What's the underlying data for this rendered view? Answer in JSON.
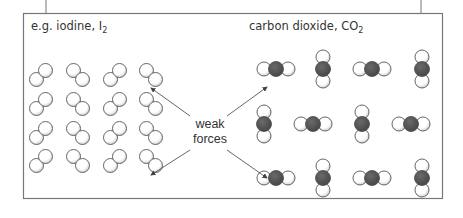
{
  "left_panel": {
    "label_prefix": "e.g. iodine, I",
    "label_subscript": "2",
    "molecule": "iodine-I2",
    "grid": {
      "rows": 4,
      "cols": 4
    }
  },
  "right_panel": {
    "label_prefix": "carbon dioxide, CO",
    "label_subscript": "2",
    "molecule": "carbon-dioxide-CO2"
  },
  "center_label": {
    "line1": "weak",
    "line2": "forces"
  },
  "colors": {
    "frame": "#777777",
    "atom_outline": "#555555",
    "atom_fill": "#ffffff",
    "atom_shade": "#bbbbbb",
    "carbon_fill": "#555555",
    "arrow": "#555555"
  }
}
